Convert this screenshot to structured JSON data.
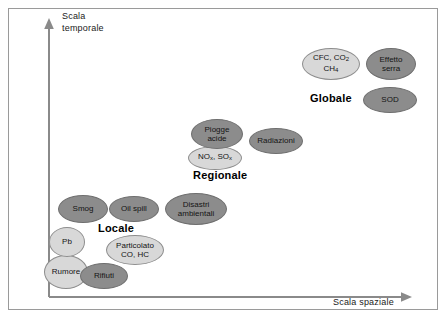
{
  "figure": {
    "background_color": "#ffffff",
    "frame_color": "#9a9a9a",
    "dark_fill": "#8c8c8c",
    "light_fill": "#d8d8d8"
  },
  "axes": {
    "y_title": "Scala\ntemporale",
    "x_title": "Scala spaziale",
    "y_axis_name": "vertical-arrow-axis",
    "x_axis_name": "horizontal-arrow-axis"
  },
  "scale_labels": [
    {
      "label": "Globale",
      "x": 310,
      "y": 92
    },
    {
      "label": "Regionale",
      "x": 193,
      "y": 169
    },
    {
      "label": "Locale",
      "x": 98,
      "y": 222
    }
  ],
  "chart_data": {
    "type": "scatter",
    "title": "",
    "xlabel": "Scala spaziale",
    "ylabel": "Scala temporale",
    "grid": false,
    "legend": "none",
    "axis_ticks": [],
    "note": "Conceptual scatter of environmental issues ordered by spatial scale (x) and temporal scale (y); three qualitative scale bands: Locale, Regionale, Globale.",
    "groups": [
      "Locale",
      "Regionale",
      "Globale"
    ],
    "points": [
      {
        "label": "Rumore",
        "group": "Locale",
        "fill": "light",
        "x": 66,
        "y": 272,
        "w": 44,
        "h": 34
      },
      {
        "label": "Pb",
        "group": "Locale",
        "fill": "light",
        "x": 67,
        "y": 242,
        "w": 36,
        "h": 30
      },
      {
        "label": "Rifiuti",
        "group": "Locale",
        "fill": "dark",
        "x": 104,
        "y": 276,
        "w": 48,
        "h": 26
      },
      {
        "label": "Particolato\nCO, HC",
        "group": "Locale",
        "fill": "light",
        "x": 135,
        "y": 250,
        "w": 58,
        "h": 30
      },
      {
        "label": "Smog",
        "group": "Locale",
        "fill": "dark",
        "x": 83,
        "y": 209,
        "w": 50,
        "h": 28
      },
      {
        "label": "Oil spill",
        "group": "Locale",
        "fill": "dark",
        "x": 134,
        "y": 209,
        "w": 50,
        "h": 26
      },
      {
        "label": "Disastri\nambientali",
        "group": "Locale",
        "fill": "dark",
        "x": 196,
        "y": 209,
        "w": 62,
        "h": 32
      },
      {
        "label": "NOx, SOx",
        "group": "Regionale",
        "fill": "light",
        "x": 215,
        "y": 158,
        "w": 54,
        "h": 24,
        "formula": true
      },
      {
        "label": "Piogge\nacide",
        "group": "Regionale",
        "fill": "dark",
        "x": 217,
        "y": 134,
        "w": 52,
        "h": 30
      },
      {
        "label": "Radiazioni",
        "group": "Regionale",
        "fill": "dark",
        "x": 276,
        "y": 141,
        "w": 54,
        "h": 26
      },
      {
        "label": "CFC, CO2\nCH4",
        "group": "Globale",
        "fill": "light",
        "x": 331,
        "y": 64,
        "w": 58,
        "h": 32,
        "formula": true
      },
      {
        "label": "Effetto\nserra",
        "group": "Globale",
        "fill": "dark",
        "x": 391,
        "y": 64,
        "w": 50,
        "h": 32
      },
      {
        "label": "SOD",
        "group": "Globale",
        "fill": "dark",
        "x": 390,
        "y": 100,
        "w": 54,
        "h": 26
      }
    ]
  }
}
